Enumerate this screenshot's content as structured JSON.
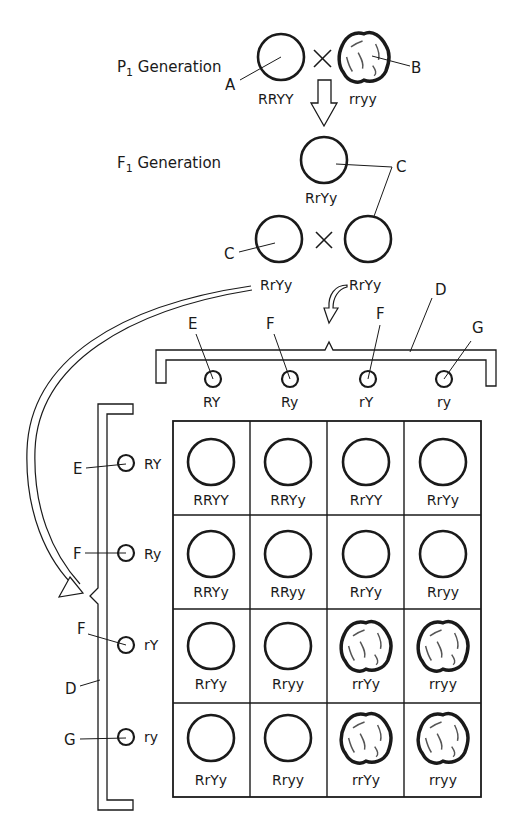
{
  "p1": {
    "label": "P",
    "sub": "1",
    "suffix": " Generation",
    "parent_a": {
      "genotype": "RRYY",
      "shape": "round",
      "pointer": "A"
    },
    "parent_b": {
      "genotype": "rryy",
      "shape": "wrinkled",
      "pointer": "B"
    },
    "cross_symbol": "×"
  },
  "f1": {
    "label": "F",
    "sub": "1",
    "suffix": " Generation",
    "offspring": {
      "genotype": "RrYy",
      "pointer": "C"
    },
    "cross": {
      "left": "RrYy",
      "right": "RrYy",
      "left_pointer": "C",
      "cross_symbol": "×"
    }
  },
  "gametes_top": {
    "bracket_label": "D",
    "items": [
      {
        "allele": "RY",
        "pointer": "E"
      },
      {
        "allele": "Ry",
        "pointer": "F"
      },
      {
        "allele": "rY",
        "pointer": "F"
      },
      {
        "allele": "ry",
        "pointer": "G"
      }
    ]
  },
  "gametes_left": {
    "bracket_label": "D",
    "items": [
      {
        "allele": "RY",
        "pointer": "E"
      },
      {
        "allele": "Ry",
        "pointer": "F"
      },
      {
        "allele": "rY",
        "pointer": "F"
      },
      {
        "allele": "ry",
        "pointer": "G"
      }
    ]
  },
  "punnett": {
    "rows": [
      [
        {
          "g": "RRYY",
          "s": "round"
        },
        {
          "g": "RRYy",
          "s": "round"
        },
        {
          "g": "RrYY",
          "s": "round"
        },
        {
          "g": "RrYy",
          "s": "round"
        }
      ],
      [
        {
          "g": "RRYy",
          "s": "round"
        },
        {
          "g": "RRyy",
          "s": "round"
        },
        {
          "g": "RrYy",
          "s": "round"
        },
        {
          "g": "Rryy",
          "s": "round"
        }
      ],
      [
        {
          "g": "RrYy",
          "s": "round"
        },
        {
          "g": "Rryy",
          "s": "round"
        },
        {
          "g": "rrYy",
          "s": "wrinkled"
        },
        {
          "g": "rryy",
          "s": "wrinkled"
        }
      ],
      [
        {
          "g": "RrYy",
          "s": "round"
        },
        {
          "g": "Rryy",
          "s": "round"
        },
        {
          "g": "rrYy",
          "s": "wrinkled"
        },
        {
          "g": "rryy",
          "s": "wrinkled"
        }
      ]
    ]
  },
  "colors": {
    "ink": "#1a1a1a",
    "background": "#ffffff"
  }
}
